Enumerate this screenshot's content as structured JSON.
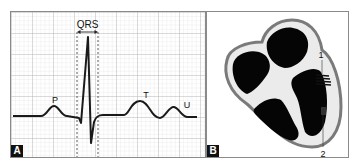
{
  "panels": [
    {
      "id": "A",
      "label": "A",
      "title": "ECG waveform",
      "annotations": {
        "qrs": "QRS",
        "p": "P",
        "t": "T",
        "u": "U"
      }
    },
    {
      "id": "B",
      "label": "B",
      "title": "Heart cross-section",
      "annotations": {
        "marker1": "1",
        "marker2": "2"
      }
    }
  ],
  "colors": {
    "grid_minor": "#e2e2e2",
    "grid_major": "#bdbdbd",
    "trace": "#1a1a1a",
    "heart_outer": "#7a7a7a",
    "heart_wall": "#e6e6e6",
    "heart_chamber": "#050505"
  }
}
